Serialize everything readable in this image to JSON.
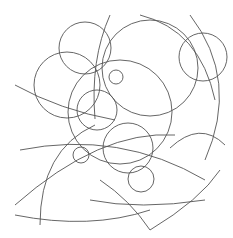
{
  "artwork": {
    "background": "#ffffff",
    "stroke": "#555555",
    "circles": [
      {
        "cx": 85,
        "cy": 48,
        "r": 26
      },
      {
        "cx": 67,
        "cy": 85,
        "r": 33
      },
      {
        "cx": 116,
        "cy": 77,
        "r": 7
      },
      {
        "cx": 150,
        "cy": 68,
        "r": 48
      },
      {
        "cx": 203,
        "cy": 57,
        "r": 24
      },
      {
        "cx": 97,
        "cy": 110,
        "r": 20
      },
      {
        "cx": 81,
        "cy": 155,
        "r": 8
      },
      {
        "cx": 141,
        "cy": 179,
        "r": 13
      },
      {
        "cx": 128,
        "cy": 148,
        "r": 25
      },
      {
        "cx": 120,
        "cy": 112,
        "r": 52
      }
    ],
    "arcs": [
      "M 15 85 Q 60 110 115 120",
      "M 110 15 Q 90 60 95 119",
      "M 140 15 Q 200 30 215 100",
      "M 190 15 Q 240 80 205 160",
      "M 20 150 Q 120 130 205 180",
      "M 15 205 Q 100 130 175 135",
      "M 40 225 Q 40 150 95 125",
      "M 15 215 Q 90 230 150 210",
      "M 170 148 Q 200 120 225 145",
      "M 100 180 Q 130 200 150 230",
      "M 150 230 Q 200 200 220 170",
      "M 90 200 Q 140 210 205 200"
    ]
  }
}
